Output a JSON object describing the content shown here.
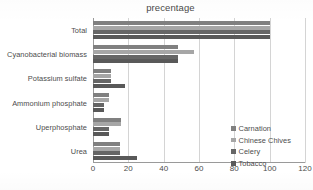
{
  "chart_data": {
    "type": "bar",
    "orientation": "horizontal",
    "title": "precentage",
    "xlabel": "",
    "ylabel": "",
    "xlim": [
      0,
      120
    ],
    "xticks": [
      0,
      20,
      40,
      60,
      80,
      100,
      120
    ],
    "grid": true,
    "legend_position": "right-bottom-inside",
    "categories": [
      "Total",
      "Cyanobacterial biomass",
      "Potassium sulfate",
      "Ammonium phosphate",
      "Uperphosphate",
      "Urea"
    ],
    "series": [
      {
        "name": "Carnation",
        "color": "#808080",
        "values": [
          100,
          48,
          10,
          9,
          16,
          15
        ]
      },
      {
        "name": "Chinese Chives",
        "color": "#a6a6a6",
        "values": [
          100,
          57,
          10,
          9,
          16,
          15
        ]
      },
      {
        "name": "Celery",
        "color": "#666666",
        "values": [
          100,
          48,
          10,
          6,
          9,
          15
        ]
      },
      {
        "name": "Tobacco",
        "color": "#595959",
        "values": [
          100,
          48,
          18,
          6,
          9,
          25
        ]
      }
    ]
  },
  "legend": {
    "items": [
      {
        "label": "Carnation"
      },
      {
        "label": "Chinese Chives"
      },
      {
        "label": "Celery"
      },
      {
        "label": "Tobacco"
      }
    ]
  }
}
